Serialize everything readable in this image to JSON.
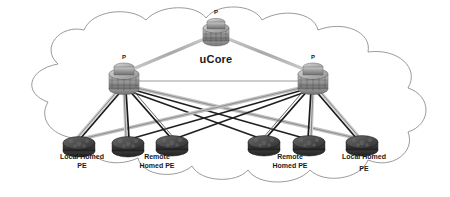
{
  "diagram": {
    "type": "network-topology",
    "cloud": {
      "label": "uCore",
      "outline_color": "#8a8a8a",
      "fill_color": "#ffffff"
    },
    "colors": {
      "link_dark": "#1a1a1a",
      "link_light": "#b4b4b4",
      "link_mid": "#6e6e6e",
      "router_body": "#9a9a9a",
      "router_dark": "#4d4d4d",
      "pe_body": "#3c3c3c",
      "text": "#1a1a1a",
      "background": "#ffffff"
    },
    "core_routers": [
      {
        "id": "p-top",
        "label": "P",
        "x": 216,
        "y": 30
      },
      {
        "id": "p-left",
        "label": "P",
        "x": 124,
        "y": 76
      },
      {
        "id": "p-right",
        "label": "P",
        "x": 313,
        "y": 76
      }
    ],
    "pe_routers": [
      {
        "id": "pe-1",
        "x": 79,
        "y": 143
      },
      {
        "id": "pe-2",
        "x": 128,
        "y": 143
      },
      {
        "id": "pe-3",
        "x": 172,
        "y": 142
      },
      {
        "id": "pe-4",
        "x": 264,
        "y": 142
      },
      {
        "id": "pe-5",
        "x": 309,
        "y": 142
      },
      {
        "id": "pe-6",
        "x": 362,
        "y": 142
      }
    ],
    "pe_labels": [
      {
        "id": "label-local-homed-pe-left",
        "line1": "Local Homed",
        "line2": "PE",
        "x": 82,
        "y": 160
      },
      {
        "id": "label-remote-homed-pe-left",
        "line1": "Remote",
        "line2": "Homed PE",
        "x": 157,
        "y": 160
      },
      {
        "id": "label-remote-homed-pe-right",
        "line1": "Remote",
        "line2": "Homed PE",
        "x": 290,
        "y": 160
      },
      {
        "id": "label-local-homed-pe-right",
        "line1": "Local Homed",
        "line2": "PE",
        "x": 363,
        "y": 160
      }
    ],
    "links": [
      {
        "from": "p-top",
        "to": "p-left",
        "style": "light"
      },
      {
        "from": "p-top",
        "to": "p-right",
        "style": "light"
      },
      {
        "from": "p-left",
        "to": "p-right",
        "style": "light"
      },
      {
        "from": "p-left",
        "to": "pe-1",
        "style": "dark"
      },
      {
        "from": "p-left",
        "to": "pe-1",
        "style": "light"
      },
      {
        "from": "p-left",
        "to": "pe-2",
        "style": "dark"
      },
      {
        "from": "p-left",
        "to": "pe-2",
        "style": "light"
      },
      {
        "from": "p-left",
        "to": "pe-3",
        "style": "dark"
      },
      {
        "from": "p-left",
        "to": "pe-4",
        "style": "dark"
      },
      {
        "from": "p-left",
        "to": "pe-5",
        "style": "dark"
      },
      {
        "from": "p-left",
        "to": "pe-6",
        "style": "light"
      },
      {
        "from": "p-right",
        "to": "pe-6",
        "style": "dark"
      },
      {
        "from": "p-right",
        "to": "pe-6",
        "style": "light"
      },
      {
        "from": "p-right",
        "to": "pe-5",
        "style": "dark"
      },
      {
        "from": "p-right",
        "to": "pe-5",
        "style": "light"
      },
      {
        "from": "p-right",
        "to": "pe-4",
        "style": "dark"
      },
      {
        "from": "p-right",
        "to": "pe-3",
        "style": "dark"
      },
      {
        "from": "p-right",
        "to": "pe-2",
        "style": "dark"
      },
      {
        "from": "p-right",
        "to": "pe-1",
        "style": "light"
      }
    ]
  }
}
